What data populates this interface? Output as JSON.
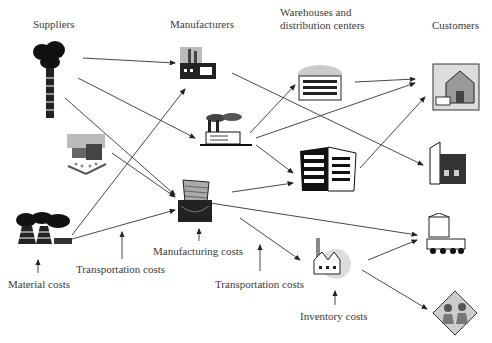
{
  "diagram": {
    "type": "supply-chain network",
    "stage_headers": [
      {
        "id": "suppliers",
        "label": "Suppliers"
      },
      {
        "id": "manufacturers",
        "label": "Manufacturers"
      },
      {
        "id": "warehouses",
        "label_line1": "Warehouses and",
        "label_line2": "distribution centers"
      },
      {
        "id": "customers",
        "label": "Customers"
      }
    ],
    "cost_labels": {
      "material": "Material costs",
      "transport1": "Transportation costs",
      "manufacturing": "Manufacturing costs",
      "transport2": "Transportation costs",
      "inventory": "Inventory costs"
    },
    "nodes": {
      "suppliers": [
        "oil-well-icon",
        "farm-barn-icon",
        "power-plant-icon"
      ],
      "manufacturers": [
        "factory-icon",
        "smoking-factory-icon",
        "modern-plant-icon"
      ],
      "warehouses": [
        "warehouse-building-icon",
        "office-tower-icon",
        "inventory-factory-icon"
      ],
      "customers": [
        "house-icon",
        "store-icon",
        "town-shop-icon",
        "family-icon"
      ]
    }
  }
}
